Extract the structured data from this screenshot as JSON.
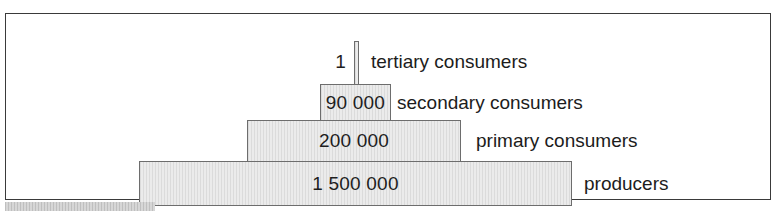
{
  "figure": {
    "kind": "ecological-pyramid-of-numbers",
    "frame_border_color": "#3a3a3a",
    "bar_fill_color": "#e3e3e3",
    "bar_border_color": "#6d6d6d",
    "text_color": "#1c1c1c"
  },
  "chart_data": {
    "type": "bar",
    "title": "",
    "subtitle": "",
    "xlabel": "",
    "ylabel": "",
    "orientation": "horizontal-centered-pyramid",
    "grid": false,
    "legend": "none",
    "categories": [
      "tertiary consumers",
      "secondary consumers",
      "primary consumers",
      "producers"
    ],
    "values": [
      1,
      90000,
      200000,
      1500000
    ],
    "value_labels": [
      "1",
      "90 000",
      "200 000",
      "1 500 000"
    ],
    "annotations": [
      "Each horizontal bar width is proportional to the number of organisms at that trophic level.",
      "Bars are centered and stacked from producers (bottom, widest) to tertiary consumers (top, narrowest)."
    ]
  },
  "tiers": [
    {
      "id": "tertiary",
      "value_label": "1",
      "name_label": "tertiary consumers",
      "value_inside_bar": false
    },
    {
      "id": "secondary",
      "value_label": "90 000",
      "name_label": "secondary consumers",
      "value_inside_bar": true
    },
    {
      "id": "primary",
      "value_label": "200 000",
      "name_label": "primary consumers",
      "value_inside_bar": true
    },
    {
      "id": "producers",
      "value_label": "1 500 000",
      "name_label": "producers",
      "value_inside_bar": true
    }
  ]
}
